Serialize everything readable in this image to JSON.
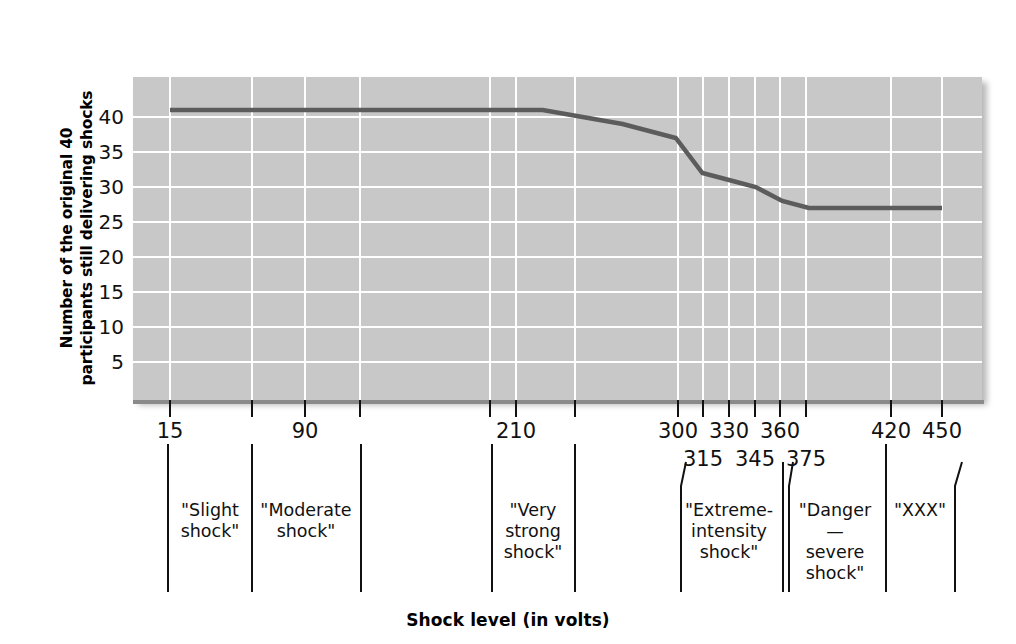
{
  "chart_data": {
    "type": "line",
    "title": "",
    "xlabel": "Shock level (in volts)",
    "ylabel": "Number of the original 40 participants still delivering shocks",
    "ylim": [
      0,
      43
    ],
    "yticks": [
      5,
      10,
      15,
      20,
      25,
      30,
      35,
      40
    ],
    "xlim": [
      0,
      465
    ],
    "xtick_labels": [
      "15",
      "90",
      "210",
      "300",
      "330",
      "360",
      "420",
      "450"
    ],
    "xtick_labels_lower": [
      "315",
      "345",
      "375"
    ],
    "grid": true,
    "legend": "none",
    "series": [
      {
        "name": "Participants still delivering shocks",
        "x": [
          15,
          90,
          150,
          210,
          225,
          270,
          300,
          315,
          330,
          345,
          360,
          375,
          420,
          450
        ],
        "values": [
          41,
          41,
          41,
          41,
          41,
          39,
          37,
          32,
          31,
          30,
          28,
          27,
          27,
          27
        ]
      }
    ],
    "line_color": "#5c5c5c",
    "plot_background": "#c8c8c8",
    "gridline_color": "#ffffff"
  },
  "axes": {
    "y_title_line1": "Number of the original 40",
    "y_title_line2": "participants still delivering shocks",
    "x_title": "Shock level (in volts)",
    "y_tick_labels": [
      "40",
      "35",
      "30",
      "25",
      "20",
      "15",
      "10",
      "5"
    ]
  },
  "x_labels_upper": [
    {
      "text": "15",
      "x": 170
    },
    {
      "text": "90",
      "x": 305
    },
    {
      "text": "210",
      "x": 516
    },
    {
      "text": "300",
      "x": 678
    },
    {
      "text": "330",
      "x": 729
    },
    {
      "text": "360",
      "x": 780
    },
    {
      "text": "420",
      "x": 891
    },
    {
      "text": "450",
      "x": 942
    }
  ],
  "x_labels_lower": [
    {
      "text": "315",
      "x": 703
    },
    {
      "text": "345",
      "x": 755
    },
    {
      "text": "375",
      "x": 806
    }
  ],
  "x_ticks": [
    170,
    252,
    305,
    360,
    490,
    516,
    575,
    678,
    703,
    729,
    755,
    780,
    806,
    891,
    942
  ],
  "categories": [
    {
      "name": "slight-shock",
      "label": "\"Slight\nshock\"",
      "cx": 210,
      "left": 168,
      "right": 252
    },
    {
      "name": "moderate-shock",
      "label": "\"Moderate\nshock\"",
      "cx": 306,
      "left": 252,
      "right": 361
    },
    {
      "name": "very-strong-shock",
      "label": "\"Very\nstrong\nshock\"",
      "cx": 533,
      "left": 492,
      "right": 575
    },
    {
      "name": "extreme-intensity-shock",
      "label": "\"Extreme-\nintensity\nshock\"",
      "cx": 729,
      "left": 681,
      "right": 783
    },
    {
      "name": "danger-severe-shock",
      "label": "\"Danger—\nsevere\nshock\"",
      "cx": 835,
      "left": 789,
      "right": 886
    },
    {
      "name": "xxx",
      "label": "\"XXX\"",
      "cx": 920,
      "left": 886,
      "right": 962
    }
  ]
}
